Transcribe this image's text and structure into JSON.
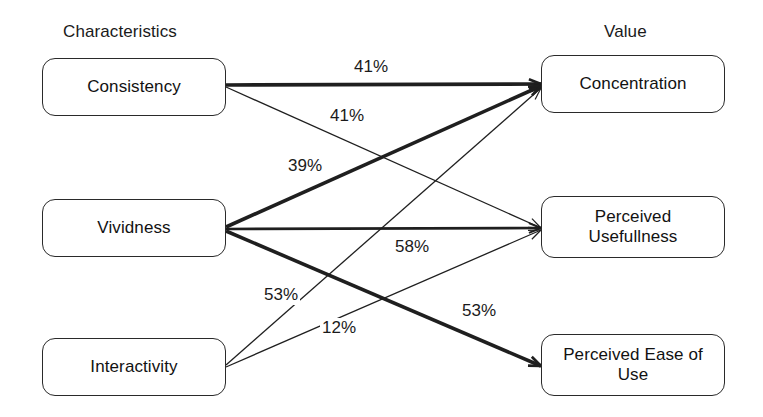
{
  "diagram": {
    "columns": [
      {
        "id": "characteristics",
        "label": "Characteristics",
        "x": 63,
        "y": 22
      },
      {
        "id": "value",
        "label": "Value",
        "x": 604,
        "y": 22
      }
    ],
    "nodes": [
      {
        "id": "consistency",
        "label": "Consistency",
        "x": 42,
        "y": 58,
        "w": 184,
        "h": 58
      },
      {
        "id": "vividness",
        "label": "Vividness",
        "x": 42,
        "y": 199,
        "w": 184,
        "h": 58
      },
      {
        "id": "interactivity",
        "label": "Interactivity",
        "x": 42,
        "y": 338,
        "w": 184,
        "h": 58
      },
      {
        "id": "concentration",
        "label": "Concentration",
        "x": 541,
        "y": 55,
        "w": 184,
        "h": 58
      },
      {
        "id": "usefulness",
        "label": "Perceived\nUsefullness",
        "x": 541,
        "y": 196,
        "w": 184,
        "h": 62
      },
      {
        "id": "ease_of_use",
        "label": "Perceived Ease of\nUse",
        "x": 541,
        "y": 334,
        "w": 184,
        "h": 62
      }
    ],
    "edges": [
      {
        "id": "consistency-concentration",
        "from": "consistency",
        "to": "concentration",
        "value": "41%",
        "weight": "thick",
        "stroke_width": 3.6,
        "x1": 226,
        "y1": 85,
        "x2": 541,
        "y2": 84,
        "label_x": 352,
        "label_y": 57
      },
      {
        "id": "consistency-usefulness",
        "from": "consistency",
        "to": "usefulness",
        "value": "41%",
        "weight": "thin",
        "stroke_width": 1.3,
        "x1": 226,
        "y1": 87,
        "x2": 541,
        "y2": 228,
        "label_x": 328,
        "label_y": 106
      },
      {
        "id": "vividness-concentration",
        "from": "vividness",
        "to": "concentration",
        "value": "39%",
        "weight": "thick",
        "stroke_width": 3.6,
        "x1": 226,
        "y1": 227,
        "x2": 541,
        "y2": 86,
        "label_x": 286,
        "label_y": 156
      },
      {
        "id": "vividness-usefulness",
        "from": "vividness",
        "to": "usefulness",
        "value": "58%",
        "weight": "medium",
        "stroke_width": 2.6,
        "x1": 226,
        "y1": 229,
        "x2": 541,
        "y2": 228,
        "label_x": 393,
        "label_y": 237
      },
      {
        "id": "vividness-ease-of-use",
        "from": "vividness",
        "to": "ease_of_use",
        "value": "53%",
        "weight": "thick",
        "stroke_width": 3.6,
        "x1": 226,
        "y1": 231,
        "x2": 541,
        "y2": 366,
        "label_x": 460,
        "label_y": 301
      },
      {
        "id": "interactivity-concentration",
        "from": "interactivity",
        "to": "concentration",
        "value": "53%",
        "weight": "thin",
        "stroke_width": 1.3,
        "x1": 226,
        "y1": 365,
        "x2": 541,
        "y2": 88,
        "label_x": 262,
        "label_y": 285
      },
      {
        "id": "interactivity-usefulness",
        "from": "interactivity",
        "to": "usefulness",
        "value": "12%",
        "weight": "thin",
        "stroke_width": 1.3,
        "x1": 226,
        "y1": 367,
        "x2": 541,
        "y2": 230,
        "label_x": 320,
        "label_y": 318
      }
    ],
    "style": {
      "line_color": "#1f1f1f",
      "box_border_color": "#2a2a2a",
      "background": "#ffffff",
      "text_color": "#121212"
    }
  }
}
